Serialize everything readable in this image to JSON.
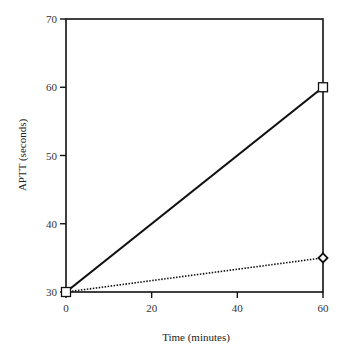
{
  "chart_data": {
    "type": "line",
    "title": "",
    "xlabel": "Time (minutes)",
    "ylabel": "APTT (seconds)",
    "xlim": [
      0,
      60
    ],
    "ylim": [
      30,
      70
    ],
    "xticks": [
      0,
      20,
      40,
      60
    ],
    "yticks": [
      30,
      40,
      50,
      60,
      70
    ],
    "grid": false,
    "legend": null,
    "x": [
      0,
      60
    ],
    "series": [
      {
        "name": "series-1",
        "style": "solid",
        "marker": "square",
        "values": [
          30,
          60
        ]
      },
      {
        "name": "series-2",
        "style": "dotted",
        "marker": "diamond",
        "values": [
          30,
          35
        ]
      }
    ]
  },
  "layout": {
    "plot": {
      "left": 66,
      "right": 323,
      "top": 19,
      "bottom": 292
    },
    "colors": {
      "axis": "#111111",
      "line": "#111111",
      "marker_fill": "#ffffff"
    }
  }
}
